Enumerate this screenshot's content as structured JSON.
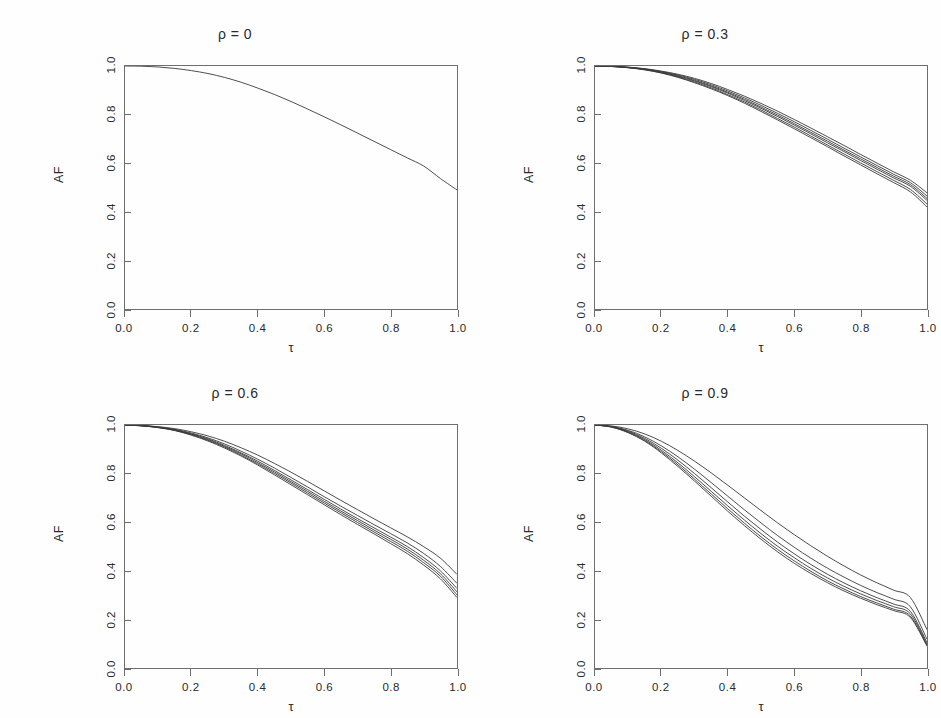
{
  "figure": {
    "background": "#fefefe",
    "line_color": "#3a3a3a",
    "axis_color": "#6e6e6e",
    "layout": "2x2 grid of line panels"
  },
  "chart_data": [
    {
      "type": "line",
      "title": "ρ = 0",
      "xlabel": "τ",
      "ylabel": "AF",
      "xlim": [
        0,
        1
      ],
      "ylim": [
        0,
        1
      ],
      "xticks": [
        "0.0",
        "0.2",
        "0.4",
        "0.6",
        "0.8",
        "1.0"
      ],
      "yticks": [
        "0.0",
        "0.2",
        "0.4",
        "0.6",
        "0.8",
        "1.0"
      ],
      "grid": false,
      "legend": "none",
      "x": [
        0.0,
        0.05,
        0.1,
        0.15,
        0.2,
        0.25,
        0.3,
        0.35,
        0.4,
        0.45,
        0.5,
        0.55,
        0.6,
        0.65,
        0.7,
        0.75,
        0.8,
        0.85,
        0.9,
        0.95,
        1.0
      ],
      "series": [
        {
          "name": "curve-1",
          "values": [
            1.0,
            0.999,
            0.996,
            0.99,
            0.981,
            0.969,
            0.953,
            0.933,
            0.909,
            0.883,
            0.854,
            0.823,
            0.791,
            0.758,
            0.724,
            0.69,
            0.656,
            0.622,
            0.588,
            0.537,
            0.49
          ]
        }
      ]
    },
    {
      "type": "line",
      "title": "ρ = 0.3",
      "xlabel": "τ",
      "ylabel": "AF",
      "xlim": [
        0,
        1
      ],
      "ylim": [
        0,
        1
      ],
      "xticks": [
        "0.0",
        "0.2",
        "0.4",
        "0.6",
        "0.8",
        "1.0"
      ],
      "yticks": [
        "0.0",
        "0.2",
        "0.4",
        "0.6",
        "0.8",
        "1.0"
      ],
      "grid": false,
      "legend": "none",
      "x": [
        0.0,
        0.05,
        0.1,
        0.15,
        0.2,
        0.25,
        0.3,
        0.35,
        0.4,
        0.45,
        0.5,
        0.55,
        0.6,
        0.65,
        0.7,
        0.75,
        0.8,
        0.85,
        0.9,
        0.95,
        1.0
      ],
      "series": [
        {
          "name": "curve-1",
          "values": [
            1.0,
            0.999,
            0.995,
            0.989,
            0.979,
            0.966,
            0.949,
            0.928,
            0.903,
            0.876,
            0.846,
            0.814,
            0.78,
            0.745,
            0.709,
            0.673,
            0.636,
            0.6,
            0.564,
            0.53,
            0.478
          ]
        },
        {
          "name": "curve-2",
          "values": [
            1.0,
            0.999,
            0.995,
            0.988,
            0.977,
            0.963,
            0.945,
            0.923,
            0.897,
            0.869,
            0.838,
            0.805,
            0.771,
            0.735,
            0.699,
            0.662,
            0.626,
            0.59,
            0.554,
            0.52,
            0.465
          ]
        },
        {
          "name": "curve-3",
          "values": [
            1.0,
            0.999,
            0.994,
            0.987,
            0.976,
            0.96,
            0.941,
            0.918,
            0.892,
            0.863,
            0.831,
            0.798,
            0.763,
            0.727,
            0.691,
            0.654,
            0.618,
            0.582,
            0.546,
            0.512,
            0.455
          ]
        },
        {
          "name": "curve-4",
          "values": [
            1.0,
            0.998,
            0.994,
            0.986,
            0.974,
            0.958,
            0.938,
            0.915,
            0.888,
            0.858,
            0.826,
            0.792,
            0.757,
            0.721,
            0.684,
            0.648,
            0.611,
            0.575,
            0.539,
            0.505,
            0.447
          ]
        },
        {
          "name": "curve-5",
          "values": [
            1.0,
            0.998,
            0.993,
            0.985,
            0.972,
            0.955,
            0.934,
            0.91,
            0.882,
            0.852,
            0.819,
            0.784,
            0.749,
            0.712,
            0.675,
            0.638,
            0.601,
            0.565,
            0.529,
            0.492,
            0.432
          ]
        },
        {
          "name": "curve-6",
          "values": [
            1.0,
            0.998,
            0.993,
            0.984,
            0.971,
            0.953,
            0.931,
            0.906,
            0.878,
            0.847,
            0.813,
            0.778,
            0.742,
            0.705,
            0.668,
            0.63,
            0.593,
            0.556,
            0.52,
            0.482,
            0.42
          ]
        }
      ]
    },
    {
      "type": "line",
      "title": "ρ = 0.6",
      "xlabel": "τ",
      "ylabel": "AF",
      "xlim": [
        0,
        1
      ],
      "ylim": [
        0,
        1
      ],
      "xticks": [
        "0.0",
        "0.2",
        "0.4",
        "0.6",
        "0.8",
        "1.0"
      ],
      "yticks": [
        "0.0",
        "0.2",
        "0.4",
        "0.6",
        "0.8",
        "1.0"
      ],
      "grid": false,
      "legend": "none",
      "x": [
        0.0,
        0.05,
        0.1,
        0.15,
        0.2,
        0.25,
        0.3,
        0.35,
        0.4,
        0.45,
        0.5,
        0.55,
        0.6,
        0.65,
        0.7,
        0.75,
        0.8,
        0.85,
        0.9,
        0.95,
        1.0
      ],
      "series": [
        {
          "name": "curve-1",
          "values": [
            1.0,
            0.998,
            0.993,
            0.985,
            0.972,
            0.955,
            0.933,
            0.906,
            0.876,
            0.842,
            0.806,
            0.768,
            0.729,
            0.69,
            0.652,
            0.614,
            0.577,
            0.54,
            0.499,
            0.452,
            0.385
          ]
        },
        {
          "name": "curve-2",
          "values": [
            1.0,
            0.998,
            0.992,
            0.982,
            0.967,
            0.947,
            0.922,
            0.892,
            0.859,
            0.823,
            0.784,
            0.745,
            0.705,
            0.666,
            0.628,
            0.59,
            0.553,
            0.515,
            0.471,
            0.418,
            0.348
          ]
        },
        {
          "name": "curve-3",
          "values": [
            1.0,
            0.997,
            0.991,
            0.98,
            0.964,
            0.943,
            0.916,
            0.885,
            0.851,
            0.813,
            0.774,
            0.734,
            0.694,
            0.654,
            0.615,
            0.577,
            0.539,
            0.5,
            0.454,
            0.4,
            0.327
          ]
        },
        {
          "name": "curve-4",
          "values": [
            1.0,
            0.997,
            0.99,
            0.979,
            0.962,
            0.94,
            0.912,
            0.881,
            0.845,
            0.807,
            0.767,
            0.727,
            0.686,
            0.646,
            0.607,
            0.568,
            0.53,
            0.49,
            0.443,
            0.388,
            0.313
          ]
        },
        {
          "name": "curve-5",
          "values": [
            1.0,
            0.997,
            0.99,
            0.978,
            0.96,
            0.937,
            0.909,
            0.876,
            0.84,
            0.801,
            0.761,
            0.72,
            0.679,
            0.639,
            0.599,
            0.56,
            0.521,
            0.481,
            0.433,
            0.378,
            0.301
          ]
        },
        {
          "name": "curve-6",
          "values": [
            1.0,
            0.996,
            0.989,
            0.977,
            0.958,
            0.934,
            0.905,
            0.872,
            0.835,
            0.795,
            0.754,
            0.713,
            0.672,
            0.631,
            0.591,
            0.552,
            0.512,
            0.471,
            0.423,
            0.367,
            0.29
          ]
        }
      ]
    },
    {
      "type": "line",
      "title": "ρ = 0.9",
      "xlabel": "τ",
      "ylabel": "AF",
      "xlim": [
        0,
        1
      ],
      "ylim": [
        0,
        1
      ],
      "xticks": [
        "0.0",
        "0.2",
        "0.4",
        "0.6",
        "0.8",
        "1.0"
      ],
      "yticks": [
        "0.0",
        "0.2",
        "0.4",
        "0.6",
        "0.8",
        "1.0"
      ],
      "grid": false,
      "legend": "none",
      "x": [
        0.0,
        0.05,
        0.1,
        0.15,
        0.2,
        0.25,
        0.3,
        0.35,
        0.4,
        0.45,
        0.5,
        0.55,
        0.6,
        0.65,
        0.7,
        0.75,
        0.8,
        0.85,
        0.9,
        0.95,
        1.0
      ],
      "series": [
        {
          "name": "curve-1",
          "values": [
            1.0,
            0.996,
            0.984,
            0.963,
            0.933,
            0.895,
            0.851,
            0.803,
            0.752,
            0.7,
            0.648,
            0.597,
            0.549,
            0.503,
            0.46,
            0.42,
            0.383,
            0.35,
            0.32,
            0.29,
            0.158
          ]
        },
        {
          "name": "curve-2",
          "values": [
            1.0,
            0.994,
            0.978,
            0.951,
            0.914,
            0.869,
            0.818,
            0.763,
            0.707,
            0.651,
            0.597,
            0.545,
            0.497,
            0.452,
            0.411,
            0.374,
            0.34,
            0.31,
            0.283,
            0.252,
            0.118
          ]
        },
        {
          "name": "curve-3",
          "values": [
            1.0,
            0.993,
            0.975,
            0.945,
            0.904,
            0.855,
            0.8,
            0.742,
            0.683,
            0.625,
            0.57,
            0.518,
            0.47,
            0.426,
            0.386,
            0.35,
            0.318,
            0.289,
            0.263,
            0.233,
            0.104
          ]
        },
        {
          "name": "curve-4",
          "values": [
            1.0,
            0.992,
            0.972,
            0.94,
            0.896,
            0.844,
            0.787,
            0.727,
            0.667,
            0.609,
            0.553,
            0.501,
            0.454,
            0.41,
            0.371,
            0.336,
            0.305,
            0.277,
            0.252,
            0.223,
            0.098
          ]
        },
        {
          "name": "curve-5",
          "values": [
            1.0,
            0.992,
            0.97,
            0.936,
            0.89,
            0.836,
            0.777,
            0.716,
            0.655,
            0.596,
            0.54,
            0.488,
            0.441,
            0.398,
            0.359,
            0.325,
            0.294,
            0.267,
            0.242,
            0.214,
            0.093
          ]
        },
        {
          "name": "curve-6",
          "values": [
            1.0,
            0.991,
            0.968,
            0.933,
            0.885,
            0.829,
            0.769,
            0.707,
            0.645,
            0.586,
            0.53,
            0.478,
            0.431,
            0.389,
            0.351,
            0.317,
            0.287,
            0.26,
            0.236,
            0.208,
            0.09
          ]
        }
      ]
    }
  ]
}
